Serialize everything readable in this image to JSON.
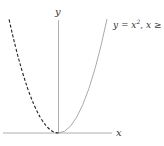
{
  "diagram": {
    "axes": {
      "x_label": "x",
      "y_label": "y",
      "axis_color": "#9a9a9a"
    },
    "curves": [
      {
        "name": "parabola-right-branch",
        "equation_label": "y = x",
        "superscript": "2",
        "condition_label": ", x ≥",
        "style": "solid",
        "color": "#aaaaaa"
      },
      {
        "name": "reflected-branch",
        "style": "dashed",
        "color": "#222222"
      }
    ]
  }
}
